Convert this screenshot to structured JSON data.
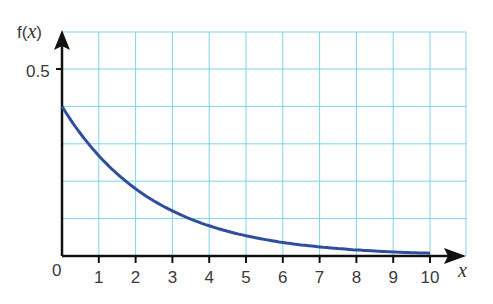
{
  "chart_data": {
    "type": "line",
    "title": "",
    "xlabel": "x",
    "ylabel": "f(x)",
    "x_ticks": [
      "0",
      "1",
      "2",
      "3",
      "4",
      "5",
      "6",
      "7",
      "8",
      "9",
      "10"
    ],
    "y_ticks": [
      "0.5"
    ],
    "xlim": [
      0,
      11
    ],
    "ylim": [
      0,
      0.6
    ],
    "grid": true,
    "grid_color": "#7fd3e8",
    "line_color": "#2f4f9e",
    "series": [
      {
        "name": "f(x)",
        "x": [
          0,
          1,
          2,
          3,
          4,
          5,
          6,
          7,
          8,
          9,
          10
        ],
        "values": [
          0.4,
          0.268,
          0.18,
          0.12,
          0.081,
          0.054,
          0.036,
          0.024,
          0.016,
          0.011,
          0.007
        ]
      }
    ]
  },
  "labels": {
    "y_axis": "f(",
    "y_axis_var": "x",
    "y_axis_close": ")",
    "x_axis": "x",
    "origin": "0",
    "y_tick_05": "0.5"
  }
}
